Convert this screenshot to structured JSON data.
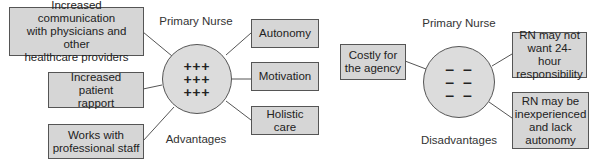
{
  "advantages": {
    "title": "Primary Nurse",
    "caption": "Advantages",
    "center_symbols": [
      "+++",
      "+++",
      "+++"
    ],
    "left_items": [
      "Increased communication\nwith physicians and other\nhealthcare providers",
      "Increased patient\nrapport",
      "Works with\nprofessional staff"
    ],
    "right_items": [
      "Autonomy",
      "Motivation",
      "Holistic care"
    ]
  },
  "disadvantages": {
    "title": "Primary Nurse",
    "caption": "Disadvantages",
    "center_symbols": [
      "– –",
      "– –",
      "– –"
    ],
    "left_items": [
      "Costly for\nthe agency"
    ],
    "right_items": [
      "RN may not\nwant 24-hour\nresponsibility",
      "RN may be\ninexperienced\nand lack\nautonomy"
    ]
  },
  "colors": {
    "box_fill": "#d6d6d6",
    "circle_fill": "#dcdcdc",
    "stroke": "#555555",
    "text": "#222222"
  }
}
